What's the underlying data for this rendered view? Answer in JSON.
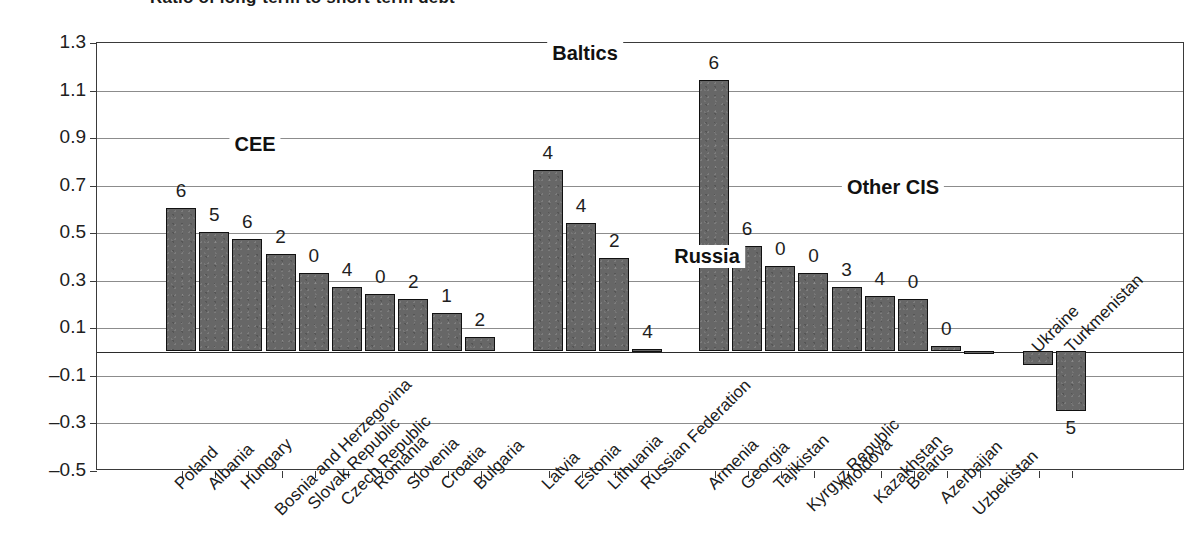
{
  "title_sliver": "Ratio of long-term to short-term debt",
  "chart_data": {
    "type": "bar",
    "title": "",
    "subtitle": "",
    "xlabel": "",
    "ylabel": "",
    "ylim": [
      -0.5,
      1.3
    ],
    "ytick_labels": [
      "1.3",
      "1.1",
      "0.9",
      "0.7",
      "0.5",
      "0.3",
      "0.1",
      "–0.1",
      "–0.3",
      "–0.5"
    ],
    "ytick_values": [
      1.3,
      1.1,
      0.9,
      0.7,
      0.5,
      0.3,
      0.1,
      -0.1,
      -0.3,
      -0.5
    ],
    "grid": true,
    "legend": "none",
    "categories": [
      "Poland",
      "Albania",
      "Hungary",
      "Bosnia and Herzegovina",
      "Slovak Republic",
      "Czech Republic",
      "Romania",
      "Slovenia",
      "Croatia",
      "Bulgaria",
      "Latvia",
      "Estonia",
      "Lithuania",
      "Russian Federation",
      "Armenia",
      "Georgia",
      "Tajikistan",
      "Kyrgyz Republic",
      "Moldova",
      "Kazakhstan",
      "Belarus",
      "Azerbaijan",
      "Uzbekistan",
      "Ukraine",
      "Turkmenistan"
    ],
    "values": [
      0.6,
      0.5,
      0.47,
      0.41,
      0.33,
      0.27,
      0.24,
      0.22,
      0.16,
      0.06,
      0.76,
      0.54,
      0.39,
      0.01,
      1.14,
      0.44,
      0.36,
      0.33,
      0.27,
      0.23,
      0.22,
      0.02,
      0.0,
      -0.06,
      -0.25
    ],
    "point_labels": [
      "6",
      "5",
      "6",
      "2",
      "0",
      "4",
      "0",
      "2",
      "1",
      "2",
      "4",
      "4",
      "2",
      "4",
      "6",
      "6",
      "0",
      "0",
      "3",
      "4",
      "0",
      "0",
      "",
      "",
      "5"
    ],
    "label_above": [
      true,
      true,
      true,
      true,
      true,
      true,
      true,
      true,
      true,
      true,
      true,
      true,
      true,
      true,
      true,
      true,
      true,
      true,
      true,
      true,
      true,
      true,
      true,
      true,
      false
    ],
    "groups": [
      {
        "name": "CEE",
        "label": "CEE",
        "start": 0,
        "end": 9
      },
      {
        "name": "Baltics",
        "label": "Baltics",
        "start": 10,
        "end": 12
      },
      {
        "name": "Russia",
        "label": "Russia",
        "start": 13,
        "end": 13
      },
      {
        "name": "Other CIS",
        "label": "Other CIS",
        "start": 14,
        "end": 24
      }
    ],
    "colors": {
      "bar_fill": "#676767",
      "bar_stroke": "#111111",
      "gridline": "#8c8c8c",
      "axis": "#3a3a3a",
      "text": "#1e1e1e",
      "background": "#ffffff"
    }
  }
}
